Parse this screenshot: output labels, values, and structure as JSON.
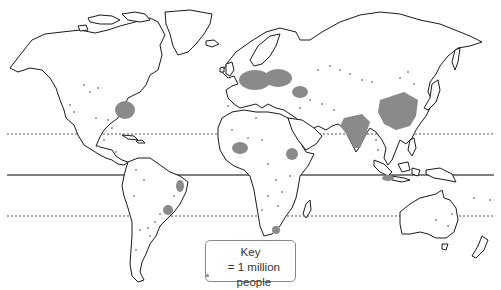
{
  "map": {
    "type": "world population distribution dot map",
    "reference_lines": [
      {
        "name": "Tropic of Cancer",
        "style": "dotted",
        "y": 134
      },
      {
        "name": "Equator",
        "style": "solid",
        "y": 175
      },
      {
        "name": "Tropic of Capricorn",
        "style": "dotted",
        "y": 216
      }
    ],
    "colors": {
      "land_fill": "#ffffff",
      "coastline": "#1a1a1a",
      "population_dot": "#8a8a8a",
      "lines": "#555555"
    },
    "key": {
      "title": "Key",
      "symbol": "dot",
      "label": "= 1 million people"
    }
  }
}
